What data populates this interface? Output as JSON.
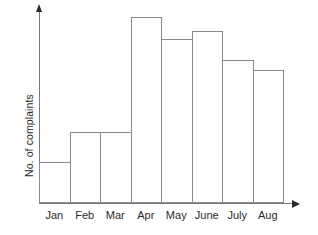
{
  "chart_data": {
    "type": "bar",
    "title": "",
    "subtitle": "",
    "xlabel": "",
    "ylabel": "No. of complaints",
    "categories": [
      "Jan",
      "Feb",
      "Mar",
      "Apr",
      "May",
      "June",
      "July",
      "Aug"
    ],
    "values": [
      41,
      71,
      71,
      186,
      164,
      172,
      143,
      133
    ],
    "series": [
      {
        "name": "No. of complaints",
        "values": [
          41,
          71,
          71,
          186,
          164,
          172,
          143,
          133
        ]
      }
    ],
    "ylim": [
      0,
      195
    ],
    "xlim": [
      0,
      8
    ],
    "grid": false,
    "legend": false,
    "legend_position": "none",
    "y_tick_labels": [],
    "x_tick_labels": [
      "Jan",
      "Feb",
      "Mar",
      "Apr",
      "May",
      "June",
      "July",
      "Aug"
    ],
    "annotations": [],
    "bar_fill_color": "#ffffff",
    "bar_border_color": "#8a8a8a",
    "axis_color": "#7a7a7a",
    "arrow_color": "#2b2b2b",
    "text_color": "#2b2b2b",
    "background_color": "#ffffff",
    "axes_have_arrow_heads": true,
    "bars_contiguous": true,
    "y_axis_values_shown": false
  },
  "axis": {
    "y_title": "No. of complaints"
  }
}
